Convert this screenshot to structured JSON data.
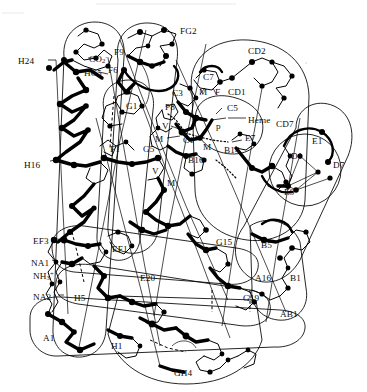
{
  "figure": {
    "background_color": "#ffffff",
    "ink_color": "#000000",
    "width": 367,
    "height": 392
  },
  "labels": [
    {
      "id": "H24",
      "text": "H24",
      "x": 18,
      "y": 57
    },
    {
      "id": "CO2",
      "text": "CO",
      "sub": "2",
      "sup": "–",
      "x": 89,
      "y": 54
    },
    {
      "id": "HC5",
      "text": "HC5",
      "x": 84,
      "y": 69
    },
    {
      "id": "F9",
      "text": "F9",
      "x": 114,
      "y": 48
    },
    {
      "id": "F6",
      "text": "F6",
      "x": 108,
      "y": 66
    },
    {
      "id": "FG2",
      "text": "FG2",
      "x": 180,
      "y": 27
    },
    {
      "id": "CD2",
      "text": "CD2",
      "x": 248,
      "y": 47
    },
    {
      "id": "C7",
      "text": "C7",
      "x": 203,
      "y": 73
    },
    {
      "id": "M_c7",
      "text": "M",
      "x": 199,
      "y": 88
    },
    {
      "id": "F_c7",
      "text": "F",
      "x": 215,
      "y": 88
    },
    {
      "id": "CD1",
      "text": "CD1",
      "x": 228,
      "y": 88
    },
    {
      "id": "C3",
      "text": "C3",
      "x": 172,
      "y": 89
    },
    {
      "id": "P8",
      "text": "P8",
      "x": 165,
      "y": 103
    },
    {
      "id": "C5",
      "text": "C5",
      "x": 227,
      "y": 104
    },
    {
      "id": "Heme",
      "text": "Heme",
      "x": 229,
      "y": 116
    },
    {
      "id": "P_heme",
      "text": "p",
      "x": 216,
      "y": 122
    },
    {
      "id": "CD7",
      "text": "CD7",
      "x": 276,
      "y": 120
    },
    {
      "id": "V_up",
      "text": "V",
      "x": 162,
      "y": 122
    },
    {
      "id": "M_up",
      "text": "M",
      "x": 157,
      "y": 135
    },
    {
      "id": "C1",
      "text": "C1",
      "x": 183,
      "y": 136
    },
    {
      "id": "E7",
      "text": "E7",
      "x": 245,
      "y": 134
    },
    {
      "id": "E1",
      "text": "E1",
      "x": 312,
      "y": 137
    },
    {
      "id": "G1",
      "text": "G1",
      "x": 126,
      "y": 102
    },
    {
      "id": "F1",
      "text": "F1",
      "x": 110,
      "y": 145
    },
    {
      "id": "G5",
      "text": "G5",
      "x": 143,
      "y": 145
    },
    {
      "id": "M_mid",
      "text": "M",
      "x": 203,
      "y": 142
    },
    {
      "id": "B14",
      "text": "B14",
      "x": 224,
      "y": 146
    },
    {
      "id": "B16",
      "text": "B16",
      "x": 188,
      "y": 155
    },
    {
      "id": "D1",
      "text": "D1",
      "x": 291,
      "y": 152
    },
    {
      "id": "D7",
      "text": "D7",
      "x": 333,
      "y": 161
    },
    {
      "id": "H16",
      "text": "H16",
      "x": 34,
      "y": 161
    },
    {
      "id": "V_low",
      "text": "V",
      "x": 152,
      "y": 166
    },
    {
      "id": "M_low",
      "text": "M",
      "x": 167,
      "y": 178
    },
    {
      "id": "E9",
      "text": "E9",
      "x": 284,
      "y": 188
    },
    {
      "id": "EF3",
      "text": "EF3",
      "x": 35,
      "y": 237
    },
    {
      "id": "EF1",
      "text": "EF1",
      "x": 114,
      "y": 245
    },
    {
      "id": "G15",
      "text": "G15",
      "x": 216,
      "y": 238
    },
    {
      "id": "B5",
      "text": "B5",
      "x": 261,
      "y": 241
    },
    {
      "id": "NA1",
      "text": "NA1",
      "x": 31,
      "y": 259
    },
    {
      "id": "NH3",
      "text": "NH",
      "sub": "3",
      "sup": "+",
      "x": 34,
      "y": 271
    },
    {
      "id": "E20",
      "text": "E20",
      "x": 140,
      "y": 274
    },
    {
      "id": "A16",
      "text": "A16",
      "x": 255,
      "y": 274
    },
    {
      "id": "B1",
      "text": "B1",
      "x": 290,
      "y": 274
    },
    {
      "id": "NA2",
      "text": "NA2",
      "x": 34,
      "y": 293
    },
    {
      "id": "H5",
      "text": "H5",
      "x": 74,
      "y": 294
    },
    {
      "id": "G19",
      "text": "G19",
      "x": 243,
      "y": 294
    },
    {
      "id": "AB1",
      "text": "AB1",
      "x": 280,
      "y": 310
    },
    {
      "id": "A1",
      "text": "A1",
      "x": 43,
      "y": 334
    },
    {
      "id": "H1",
      "text": "H1",
      "x": 111,
      "y": 342
    },
    {
      "id": "GH4",
      "text": "GH4",
      "x": 174,
      "y": 369
    }
  ],
  "diagram_data": {
    "type": "molecular-schematic",
    "molecule": "myoglobin",
    "description": "Schematic of the myoglobin polypeptide chain fold showing helical segments A through H, the heme group, and residue contact points.",
    "helix_segments": [
      "A",
      "AB",
      "B",
      "C",
      "CD",
      "D",
      "E",
      "EF",
      "F",
      "FG",
      "G",
      "GH",
      "H",
      "NA",
      "HC"
    ],
    "termini": [
      "NH3+ (N-terminus, NA1)",
      "CO2- (C-terminus, HC5)"
    ],
    "ligand": "Heme"
  }
}
